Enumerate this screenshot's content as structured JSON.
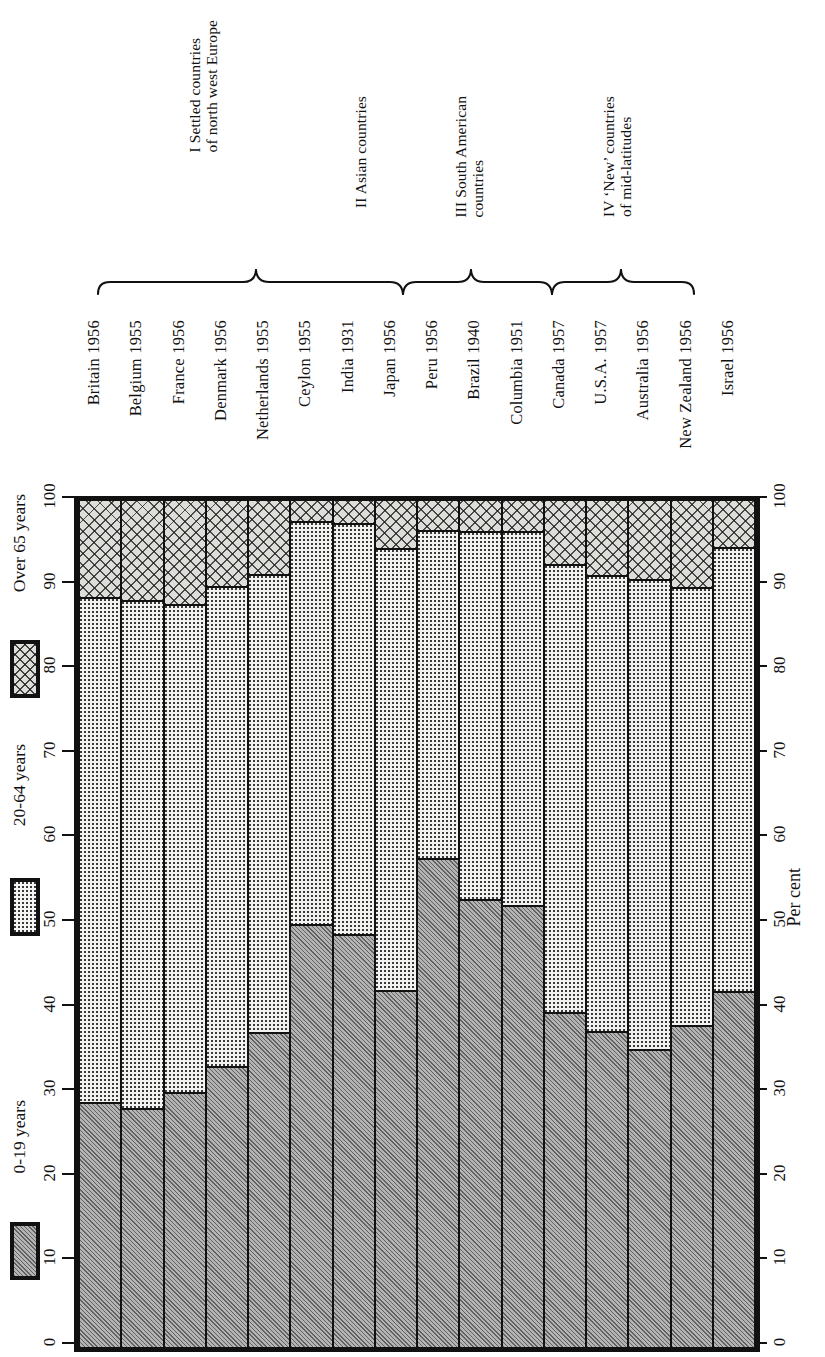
{
  "chart_data": {
    "type": "bar",
    "subtype": "stacked-bar-100-percent",
    "orientation": "vertical-bars-rotated-page",
    "title": "",
    "xlabel": "",
    "ylabel": "Per cent",
    "ylim": [
      0,
      100
    ],
    "ytick_values": [
      0,
      10,
      20,
      30,
      40,
      50,
      60,
      70,
      80,
      90,
      100
    ],
    "ytick_labels": [
      "0",
      "10",
      "20",
      "30",
      "40",
      "50",
      "60",
      "70",
      "80",
      "90",
      "100"
    ],
    "grid": false,
    "legend_position": "left-outside",
    "categories": [
      "Britain 1956",
      "Belgium 1955",
      "France 1956",
      "Denmark 1956",
      "Netherlands 1955",
      "Ceylon 1955",
      "India 1931",
      "Japan 1956",
      "Peru 1956",
      "Brazil 1940",
      "Columbia 1951",
      "Canada 1957",
      "U.S.A. 1957",
      "Australia 1956",
      "New Zealand 1956",
      "Israel 1956"
    ],
    "series": [
      {
        "name": "0-19 years",
        "fill": "diagonal-hatch-grey",
        "values": [
          29.0,
          28.3,
          30.2,
          33.2,
          37.2,
          50.0,
          48.8,
          42.2,
          57.8,
          52.9,
          52.3,
          39.6,
          37.3,
          35.2,
          38.1,
          42.1
        ]
      },
      {
        "name": "20-64 years",
        "fill": "fine-dot-stipple",
        "values": [
          59.6,
          60.0,
          57.6,
          56.8,
          54.2,
          47.6,
          48.6,
          52.3,
          38.8,
          43.5,
          44.1,
          53.0,
          53.9,
          55.6,
          51.7,
          52.5
        ]
      },
      {
        "name": "Over 65 years",
        "fill": "cross-hatch",
        "values": [
          11.4,
          11.7,
          12.2,
          10.0,
          8.6,
          2.4,
          2.6,
          5.5,
          3.4,
          3.6,
          3.6,
          7.4,
          8.8,
          9.2,
          10.2,
          5.4
        ]
      }
    ],
    "cumulative_boundaries": {
      "note": "top edge of 0-19 band and top edge of 20-64 band, in per cent",
      "young_top": [
        29.0,
        28.3,
        30.2,
        33.2,
        37.2,
        50.0,
        48.8,
        42.2,
        57.8,
        52.9,
        52.3,
        39.6,
        37.3,
        35.2,
        38.1,
        42.1
      ],
      "mid_top": [
        88.6,
        88.3,
        87.8,
        90.0,
        91.4,
        97.6,
        97.4,
        94.5,
        96.6,
        96.4,
        96.4,
        92.6,
        91.2,
        90.8,
        89.8,
        94.6
      ]
    },
    "annotations": {
      "groups": [
        {
          "roman": "I",
          "label": "I Settled countries\nof north west Europe",
          "line1": "I Settled countries",
          "line2": "of north west Europe",
          "members": [
            0,
            1,
            2,
            3,
            4
          ]
        },
        {
          "roman": "II",
          "label": "II Asian countries",
          "line1": "II Asian countries",
          "line2": "",
          "members": [
            5,
            6,
            7
          ]
        },
        {
          "roman": "III",
          "label": "III South American countries",
          "line1": "III South American",
          "line2": "countries",
          "members": [
            8,
            9,
            10
          ]
        },
        {
          "roman": "IV",
          "label": "IV 'New' countries of mid-latitudes",
          "line1": "IV ‘New’ countries",
          "line2": "of mid-latitudes",
          "members": [
            11,
            12,
            13,
            14,
            15
          ]
        }
      ]
    }
  },
  "legend": {
    "items": [
      {
        "label": "0-19 years",
        "fill": "diagonal-hatch-grey"
      },
      {
        "label": "20-64 years",
        "fill": "fine-dot-stipple"
      },
      {
        "label": "Over 65 years",
        "fill": "cross-hatch"
      }
    ]
  },
  "axes": {
    "left": {
      "labels": [
        "0",
        "10",
        "20",
        "30",
        "40",
        "50",
        "60",
        "70",
        "80",
        "90",
        "100"
      ]
    },
    "right": {
      "labels": [
        "0",
        "10",
        "20",
        "30",
        "40",
        "50",
        "60",
        "70",
        "80",
        "90",
        "100"
      ],
      "title": "Per cent"
    }
  }
}
